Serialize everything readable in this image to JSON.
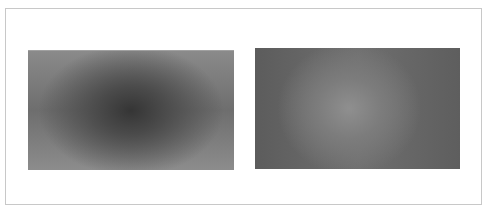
{
  "figure": {
    "panels": [
      {
        "name": "left-gradient",
        "center_tone": "dark",
        "center_color": "#353535",
        "edge_color": "#8a8a8a"
      },
      {
        "name": "right-gradient",
        "center_tone": "light",
        "center_color": "#8f8f8f",
        "edge_color": "#5c5c5c"
      }
    ],
    "border_color": "#c8c8c8"
  }
}
